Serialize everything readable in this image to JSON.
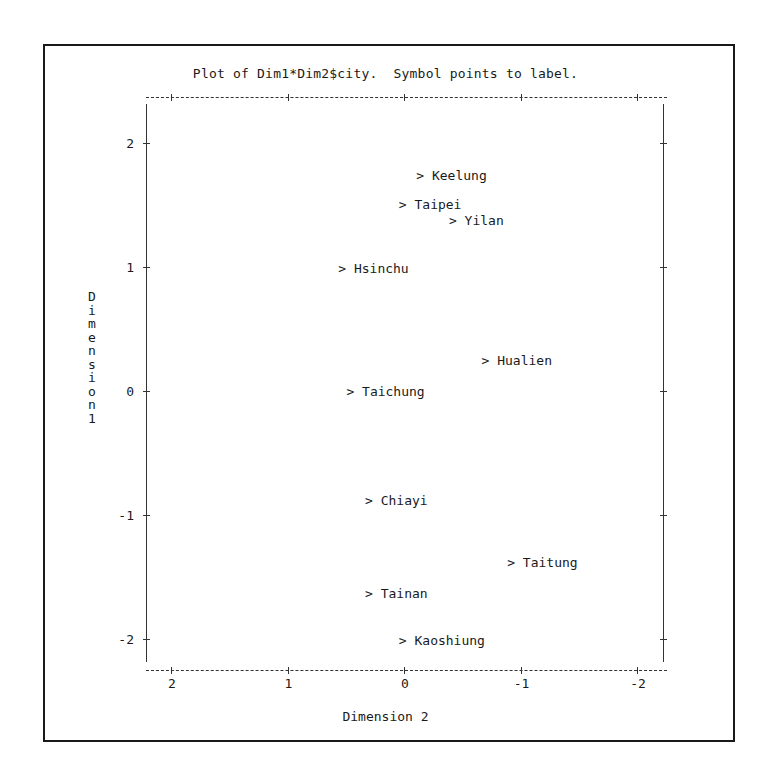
{
  "chart_data": {
    "type": "scatter",
    "title": "Plot of Dim1*Dim2$city.  Symbol points to label.",
    "xlabel": "Dimension 2",
    "ylabel": "Dimension 1",
    "xlim": [
      2.2,
      -2.2
    ],
    "ylim": [
      -2.25,
      2.4
    ],
    "x_reversed": true,
    "grid": false,
    "legend": null,
    "marker": ">",
    "xticks": [
      2,
      1,
      0,
      -1,
      -2
    ],
    "xtick_labels": [
      "2",
      "1",
      "0",
      "-1",
      "-2"
    ],
    "yticks": [
      2,
      1,
      0,
      -1,
      -2
    ],
    "ytick_labels": [
      "2",
      "1",
      "0",
      "-1",
      "-2"
    ],
    "points": [
      {
        "label": "Keelung",
        "x": -0.14,
        "y": 1.74
      },
      {
        "label": "Taipei",
        "x": 0.01,
        "y": 1.51
      },
      {
        "label": "Yilan",
        "x": -0.42,
        "y": 1.38
      },
      {
        "label": "Hsinchu",
        "x": 0.53,
        "y": 0.99
      },
      {
        "label": "Hualien",
        "x": -0.7,
        "y": 0.25
      },
      {
        "label": "Taichung",
        "x": 0.46,
        "y": 0.0
      },
      {
        "label": "Chiayi",
        "x": 0.3,
        "y": -0.88
      },
      {
        "label": "Taitung",
        "x": -0.92,
        "y": -1.38
      },
      {
        "label": "Tainan",
        "x": 0.3,
        "y": -1.63
      },
      {
        "label": "Kaoshiung",
        "x": 0.01,
        "y": -2.01
      }
    ]
  },
  "title": "Plot of Dim1*Dim2$city.  Symbol points to label.",
  "x_axis_title": "Dimension 2",
  "y_axis_title": "Dimension 1",
  "marker_symbol": ">"
}
